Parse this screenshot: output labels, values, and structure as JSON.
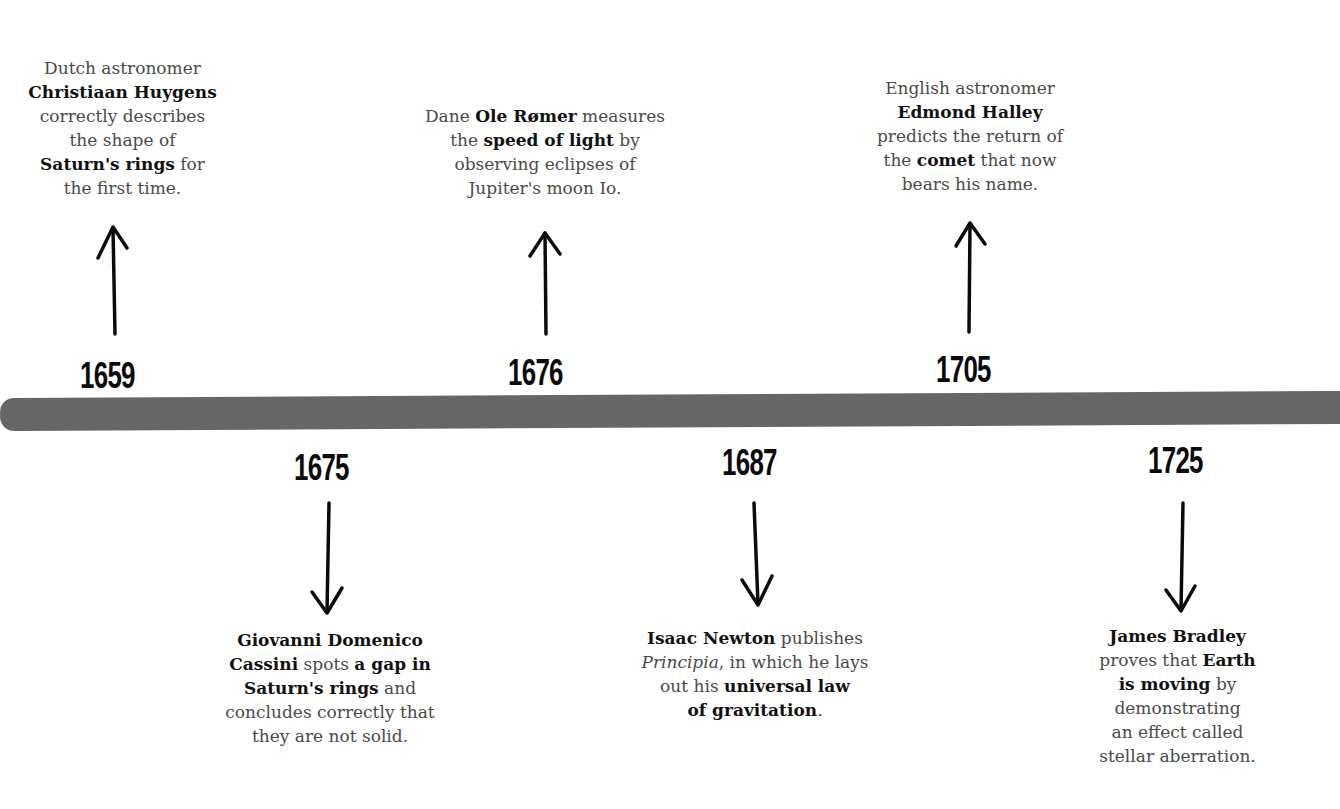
{
  "timeline": {
    "band_color": "#666666",
    "events_above": [
      {
        "year": "1659",
        "lines": [
          [
            {
              "t": "Dutch astronomer",
              "b": false
            }
          ],
          [
            {
              "t": "Christiaan Huygens",
              "b": true
            }
          ],
          [
            {
              "t": "correctly describes",
              "b": false
            }
          ],
          [
            {
              "t": "the shape of",
              "b": false
            }
          ],
          [
            {
              "t": "Saturn's rings",
              "b": true
            },
            {
              "t": " for",
              "b": false
            }
          ],
          [
            {
              "t": "the first time.",
              "b": false
            }
          ]
        ]
      },
      {
        "year": "1676",
        "lines": [
          [
            {
              "t": "Dane ",
              "b": false
            },
            {
              "t": "Ole Rømer",
              "b": true
            },
            {
              "t": " measures",
              "b": false
            }
          ],
          [
            {
              "t": "the ",
              "b": false
            },
            {
              "t": "speed of light",
              "b": true
            },
            {
              "t": " by",
              "b": false
            }
          ],
          [
            {
              "t": "observing eclipses of",
              "b": false
            }
          ],
          [
            {
              "t": "Jupiter's moon Io.",
              "b": false
            }
          ]
        ]
      },
      {
        "year": "1705",
        "lines": [
          [
            {
              "t": "English astronomer",
              "b": false
            }
          ],
          [
            {
              "t": "Edmond Halley",
              "b": true
            }
          ],
          [
            {
              "t": "predicts the return of",
              "b": false
            }
          ],
          [
            {
              "t": "the ",
              "b": false
            },
            {
              "t": "comet",
              "b": true
            },
            {
              "t": " that now",
              "b": false
            }
          ],
          [
            {
              "t": "bears his name.",
              "b": false
            }
          ]
        ]
      }
    ],
    "events_below": [
      {
        "year": "1675",
        "lines": [
          [
            {
              "t": "Giovanni Domenico",
              "b": true
            }
          ],
          [
            {
              "t": "Cassini",
              "b": true
            },
            {
              "t": " spots ",
              "b": false
            },
            {
              "t": "a gap in",
              "b": true
            }
          ],
          [
            {
              "t": "Saturn's rings",
              "b": true
            },
            {
              "t": " and",
              "b": false
            }
          ],
          [
            {
              "t": "concludes correctly that",
              "b": false
            }
          ],
          [
            {
              "t": "they are not solid.",
              "b": false
            }
          ]
        ]
      },
      {
        "year": "1687",
        "lines": [
          [
            {
              "t": "Isaac Newton",
              "b": true
            },
            {
              "t": " publishes",
              "b": false
            }
          ],
          [
            {
              "t": "Principia",
              "i": true
            },
            {
              "t": ", in which he lays",
              "b": false
            }
          ],
          [
            {
              "t": "out his ",
              "b": false
            },
            {
              "t": "universal law",
              "b": true
            }
          ],
          [
            {
              "t": "of gravitation",
              "b": true
            },
            {
              "t": ".",
              "b": false
            }
          ]
        ]
      },
      {
        "year": "1725",
        "lines": [
          [
            {
              "t": "James Bradley",
              "b": true
            }
          ],
          [
            {
              "t": "proves that ",
              "b": false
            },
            {
              "t": "Earth",
              "b": true
            }
          ],
          [
            {
              "t": "is moving",
              "b": true
            },
            {
              "t": " by",
              "b": false
            }
          ],
          [
            {
              "t": "demonstrating",
              "b": false
            }
          ],
          [
            {
              "t": "an effect called",
              "b": false
            }
          ],
          [
            {
              "t": "stellar aberration.",
              "b": false
            }
          ]
        ]
      }
    ]
  }
}
